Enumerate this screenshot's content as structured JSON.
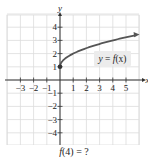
{
  "chart_data": {
    "type": "line",
    "title": "",
    "xlabel": "x",
    "ylabel": "y",
    "xlim": [
      -3.9,
      6.0
    ],
    "ylim": [
      -4.9,
      5.0
    ],
    "grid": true,
    "x_ticks": [
      -3,
      -2,
      -1,
      1,
      2,
      3,
      4,
      5
    ],
    "y_ticks": [
      -4,
      -3,
      -2,
      -1,
      1,
      2,
      3,
      4
    ],
    "x_tick_labels": [
      "−3",
      "−2",
      "−1",
      "1",
      "2",
      "3",
      "4",
      "5"
    ],
    "y_tick_labels": [
      "−4",
      "−3",
      "−2",
      "−1",
      "1",
      "2",
      "3",
      "4"
    ],
    "series": [
      {
        "name": "y = f(x)",
        "x": [
          0,
          0.25,
          0.5,
          1,
          1.5,
          2,
          3,
          4,
          5,
          5.8
        ],
        "y": [
          1,
          1.5,
          1.71,
          2,
          2.22,
          2.41,
          2.73,
          3,
          3.24,
          3.41
        ],
        "start_point": [
          0,
          1
        ],
        "end_arrow": true
      }
    ],
    "annotations": [
      {
        "text": "y = f(x)",
        "x": 3.5,
        "y": 1.7,
        "boxed": true
      }
    ],
    "legend": null
  },
  "labels": {
    "x_axis": "x",
    "y_axis": "y",
    "curve_label_y": "y",
    "curve_label_eq": " = ",
    "curve_label_f": "f",
    "curve_label_arg": "(x)",
    "question": "f(4) = ?",
    "question_f": "f",
    "question_rest": "(4) = ?"
  },
  "colors": {
    "grid": "#dcdcdc",
    "axis": "#333333",
    "curve": "#555555",
    "label_box": "#ececec",
    "text": "#222222"
  }
}
